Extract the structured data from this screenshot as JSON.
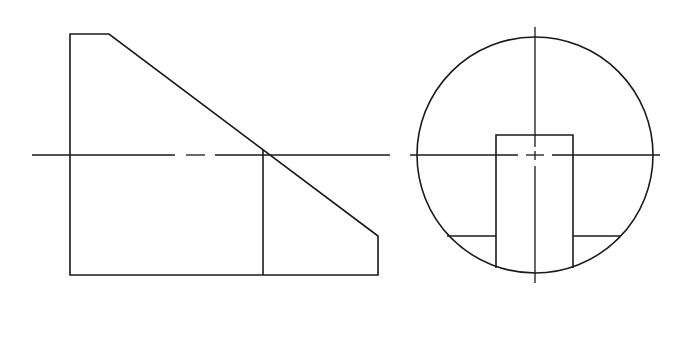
{
  "drawing": {
    "title": "Orthographic projection: front view and side view of truncated cylinder with slot",
    "colors": {
      "background": "#ffffff",
      "line": "#1a1a1a"
    },
    "front_view": {
      "label": "Front view",
      "outline_points": [
        [
          70,
          34
        ],
        [
          109,
          34
        ],
        [
          378,
          236
        ],
        [
          378,
          275
        ],
        [
          70,
          275
        ]
      ],
      "inner_line": {
        "x": 263,
        "y1": 150,
        "y2": 275
      },
      "centerline": {
        "y": 155,
        "segments": [
          [
            32,
            175
          ],
          [
            186,
            205
          ],
          [
            215,
            390
          ]
        ]
      }
    },
    "side_view": {
      "label": "Side view",
      "circle": {
        "cx": 535,
        "cy": 155,
        "r": 118
      },
      "slot_rect": {
        "x1": 496,
        "x2": 573,
        "top": 135,
        "bottom_left": 268,
        "bottom_right": 268
      },
      "ledge_lines": [
        {
          "x1": 447,
          "x2": 496,
          "y": 236
        },
        {
          "x1": 573,
          "x2": 621,
          "y": 236
        }
      ],
      "horizontal_centerline": {
        "y": 155,
        "segments": [
          [
            410,
            518
          ],
          [
            526,
            544
          ],
          [
            552,
            660
          ]
        ]
      },
      "vertical_centerline": {
        "x": 535,
        "segments": [
          [
            27,
            147
          ],
          [
            151,
            160
          ],
          [
            166,
            283
          ]
        ]
      }
    }
  }
}
